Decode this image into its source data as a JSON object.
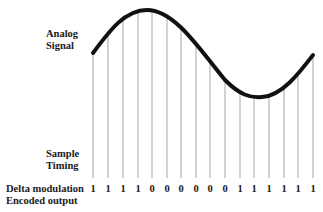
{
  "labels": {
    "analog_signal": [
      "Analog",
      "Signal"
    ],
    "sample_timing": [
      "Sample",
      "Timing"
    ],
    "delta_modulation": [
      "Delta modulation",
      "Encoded output"
    ]
  },
  "samples": {
    "count": 16,
    "x_positions": [
      93,
      108,
      123,
      138,
      152,
      167,
      181,
      196,
      210,
      225,
      240,
      254,
      269,
      284,
      298,
      313
    ],
    "bits": [
      "1",
      "1",
      "1",
      "1",
      "0",
      "0",
      "0",
      "0",
      "0",
      "0",
      "1",
      "1",
      "1",
      "1",
      "1",
      "1"
    ],
    "line_color": "#b5b5b5"
  },
  "signal": {
    "color": "#111111",
    "stroke_width": 4
  }
}
